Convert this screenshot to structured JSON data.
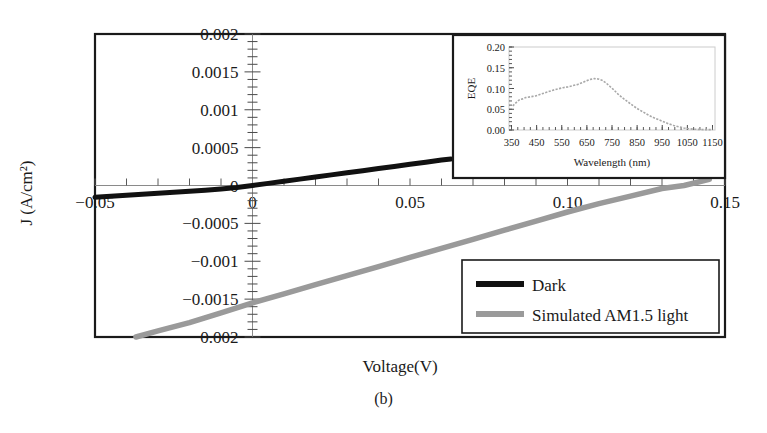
{
  "figure": {
    "caption": "(b)",
    "panel_label": "(b)"
  },
  "chart_data": {
    "type": "line",
    "title": "",
    "xlabel": "Voltage(V)",
    "ylabel": "J (A/cm²)",
    "xlim": [
      -0.05,
      0.15
    ],
    "ylim": [
      -0.002,
      0.002
    ],
    "grid": false,
    "legend_position": "bottom-right",
    "x_ticks": [
      -0.05,
      0,
      0.05,
      0.1,
      0.15
    ],
    "x_tick_labels": [
      "−0.05",
      "0",
      "0.05",
      "0.10",
      "0.15"
    ],
    "y_ticks": [
      -0.002,
      -0.0015,
      -0.001,
      -0.0005,
      0,
      0.0005,
      0.001,
      0.0015,
      0.002
    ],
    "y_tick_labels": [
      "−0.002",
      "−0.0015",
      "−0.001",
      "−0.0005",
      "0",
      "0.0005",
      "0.001",
      "0.0015",
      "0.002"
    ],
    "x_minor_tick_step": 0.01,
    "y_minor_tick_step": 0.0001,
    "series": [
      {
        "name": "Dark",
        "color": "#111111",
        "x": [
          -0.05,
          -0.045,
          -0.04,
          -0.035,
          -0.03,
          -0.025,
          -0.02,
          -0.015,
          -0.01,
          -0.005,
          0.0,
          0.005,
          0.01,
          0.015,
          0.02,
          0.025,
          0.03,
          0.035,
          0.04,
          0.045,
          0.05,
          0.055,
          0.06,
          0.063
        ],
        "y": [
          -0.000155,
          -0.000142,
          -0.000129,
          -0.000116,
          -0.000103,
          -9e-05,
          -7.6e-05,
          -6.2e-05,
          -4.6e-05,
          -2.6e-05,
          0.0,
          2.8e-05,
          5.6e-05,
          8.4e-05,
          0.000112,
          0.00014,
          0.000168,
          0.000196,
          0.000224,
          0.000252,
          0.00028,
          0.000308,
          0.000336,
          0.00035
        ]
      },
      {
        "name": "Simulated AM1.5 light",
        "color": "#9a9a9a",
        "x": [
          -0.037,
          -0.03,
          -0.02,
          -0.01,
          0.0,
          0.01,
          0.02,
          0.03,
          0.04,
          0.05,
          0.06,
          0.07,
          0.08,
          0.09,
          0.1,
          0.11,
          0.12,
          0.13,
          0.137,
          0.145
        ],
        "y": [
          -0.002,
          -0.00192,
          -0.00181,
          -0.00168,
          -0.00155,
          -0.00143,
          -0.00131,
          -0.00119,
          -0.00107,
          -0.00095,
          -0.00083,
          -0.00071,
          -0.00059,
          -0.00047,
          -0.00035,
          -0.00024,
          -0.00014,
          -4e-05,
          0.0,
          8e-05
        ]
      }
    ],
    "legend_entries": [
      {
        "label": "Dark",
        "color": "#111111"
      },
      {
        "label": "Simulated AM1.5 light",
        "color": "#9a9a9a"
      }
    ],
    "inset": {
      "type": "scatter",
      "xlabel": "Wavelength (nm)",
      "ylabel": "EQE",
      "xlim": [
        340,
        1160
      ],
      "ylim": [
        0.0,
        0.2
      ],
      "grid": false,
      "x_ticks": [
        350,
        450,
        550,
        650,
        750,
        850,
        950,
        1050,
        1150
      ],
      "x_tick_labels": [
        "350",
        "450",
        "550",
        "650",
        "750",
        "850",
        "950",
        "1050",
        "1150"
      ],
      "y_ticks": [
        0.0,
        0.05,
        0.1,
        0.15,
        0.2
      ],
      "y_tick_labels": [
        "0.00",
        "0.05",
        "0.10",
        "0.15",
        "0.20"
      ],
      "series_color": "#a8a8a8",
      "x": [
        355,
        365,
        375,
        385,
        395,
        405,
        415,
        425,
        435,
        445,
        455,
        475,
        495,
        515,
        535,
        555,
        575,
        595,
        615,
        635,
        650,
        665,
        680,
        695,
        710,
        725,
        740,
        755,
        775,
        795,
        815,
        835,
        855,
        875,
        895,
        915,
        935,
        955,
        975,
        995,
        1015,
        1035,
        1055,
        1075,
        1095,
        1115,
        1135,
        1150
      ],
      "y": [
        0.058,
        0.064,
        0.07,
        0.074,
        0.075,
        0.078,
        0.079,
        0.08,
        0.081,
        0.082,
        0.084,
        0.088,
        0.092,
        0.096,
        0.099,
        0.102,
        0.104,
        0.107,
        0.11,
        0.115,
        0.119,
        0.122,
        0.124,
        0.123,
        0.12,
        0.114,
        0.106,
        0.098,
        0.086,
        0.076,
        0.067,
        0.058,
        0.05,
        0.043,
        0.036,
        0.03,
        0.025,
        0.02,
        0.015,
        0.011,
        0.008,
        0.005,
        0.003,
        0.002,
        0.0015,
        0.001,
        0.001,
        0.001
      ]
    }
  }
}
